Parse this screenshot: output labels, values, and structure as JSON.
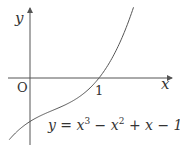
{
  "chart_data": {
    "type": "line",
    "title": "",
    "xlabel": "x",
    "ylabel": "y",
    "origin_label": "O",
    "x_ticks": [
      {
        "value": 1,
        "label": "1"
      }
    ],
    "function": "y = x^3 - x^2 + x - 1",
    "annotation": "y = x³ − x² + x − 1",
    "key_points": [
      {
        "x": 0,
        "y": -1,
        "note": "y-intercept"
      },
      {
        "x": 1,
        "y": 0,
        "note": "x-intercept"
      }
    ],
    "series": [
      {
        "name": "y = x^3 - x^2 + x - 1",
        "x": [
          -0.3,
          -0.2,
          -0.1,
          0,
          0.2,
          0.4,
          0.6,
          0.8,
          1.0,
          1.2,
          1.4,
          1.5
        ],
        "y": [
          -1.417,
          -1.248,
          -1.111,
          -1.0,
          -0.832,
          -0.696,
          -0.544,
          -0.328,
          0.0,
          0.488,
          1.184,
          1.625
        ]
      }
    ],
    "xlim": [
      -0.43,
      2.0
    ],
    "ylim": [
      -1.5,
      1.7
    ],
    "grid": false,
    "legend": "none"
  },
  "labels": {
    "y_axis": "y",
    "x_axis": "x",
    "origin": "O",
    "tick_one": "1",
    "eq_prefix": "y = x",
    "eq_exp3": "3",
    "eq_mid": " − x",
    "eq_exp2": "2",
    "eq_suffix": " + x − 1"
  },
  "colors": {
    "axis": "#555555",
    "curve": "#555555",
    "text": "#333333"
  }
}
